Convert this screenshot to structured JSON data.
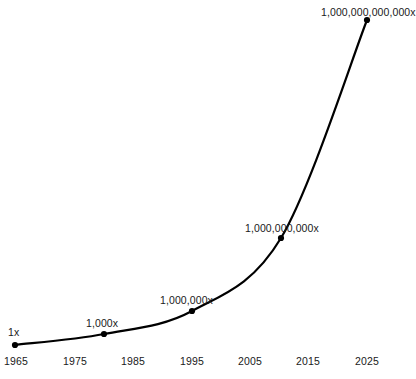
{
  "chart_data": {
    "type": "line",
    "title": "",
    "subtitle": "",
    "xlabel": "",
    "ylabel": "",
    "yscale": "log",
    "grid": false,
    "legend": "none",
    "xlim": [
      1965,
      2027
    ],
    "ylim": [
      1,
      1000000000000
    ],
    "x_ticks": [
      "1965",
      "1975",
      "1985",
      "1995",
      "2005",
      "2015",
      "2025"
    ],
    "x_tick_values": [
      1965,
      1975,
      1985,
      1995,
      2005,
      2015,
      2025
    ],
    "y_ticks": [],
    "series": [
      {
        "name": "Relative compute / performance",
        "x": [
          1965,
          1980,
          1995,
          2010,
          2025
        ],
        "values": [
          1,
          1000,
          1000000,
          1000000000,
          1000000000000
        ],
        "point_labels": [
          "1x",
          "1,000x",
          "1,000,000x",
          "1,000,000,000x",
          "1,000,000,000,000x"
        ],
        "color": "#000000",
        "marker": "circle",
        "line_width": 2.2
      }
    ],
    "annotations": []
  },
  "points": [
    {
      "label": "1x",
      "px": 15,
      "py": 345,
      "label_x": 8,
      "label_y": 326,
      "align": "left"
    },
    {
      "label": "1,000x",
      "px": 104,
      "py": 334,
      "label_x": 86,
      "label_y": 317,
      "align": "left"
    },
    {
      "label": "1,000,000x",
      "px": 192,
      "py": 311,
      "label_x": 160,
      "label_y": 294,
      "align": "left"
    },
    {
      "label": "1,000,000,000x",
      "px": 281,
      "py": 238,
      "label_x": 245,
      "label_y": 222,
      "align": "left"
    },
    {
      "label": "1,000,000,000,000x",
      "px": 367,
      "py": 20,
      "label_x": 321,
      "label_y": 6,
      "align": "left"
    }
  ],
  "x_axis": {
    "ticks": [
      {
        "label": "1965",
        "px": 16
      },
      {
        "label": "1975",
        "px": 75
      },
      {
        "label": "1985",
        "px": 133
      },
      {
        "label": "1995",
        "px": 192
      },
      {
        "label": "2005",
        "px": 250
      },
      {
        "label": "2015",
        "px": 308
      },
      {
        "label": "2025",
        "px": 367
      }
    ],
    "baseline_y": 355
  },
  "style": {
    "background": "#ffffff",
    "curve_color": "#000000",
    "text_color": "#1a1a1a",
    "marker_radius": 3.1
  }
}
